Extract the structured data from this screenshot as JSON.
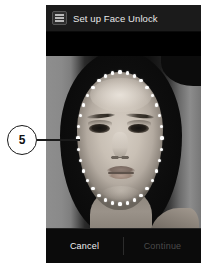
{
  "callout": {
    "number": "5"
  },
  "window": {
    "title": "Set up Face Unlock",
    "app_icon": "settings-icon"
  },
  "photo": {
    "description": "Grayscale front-facing camera preview of a woman's face",
    "overlay": "dotted-oval-face-guide",
    "dot_color": "#ffffff",
    "dot_count": 36
  },
  "buttons": {
    "cancel_label": "Cancel",
    "continue_label": "Continue",
    "continue_enabled": false
  },
  "colors": {
    "page_background": "#ffffff",
    "window_background": "#000000",
    "title_bar": "#1b1b1b",
    "title_text": "#e8e8e8",
    "button_bar": "#0b0b0b",
    "cancel_text": "#f0f0f0",
    "continue_text": "#4a4a4a",
    "callout_stroke": "#1a1a1a"
  }
}
